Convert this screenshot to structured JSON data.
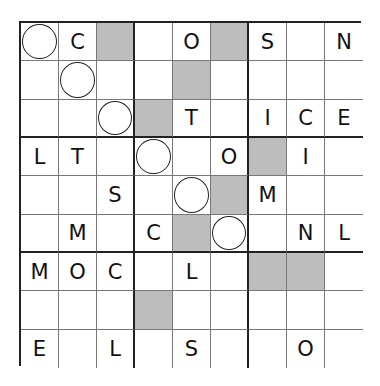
{
  "puzzle": {
    "type": "letter-sudoku",
    "size": 9,
    "legend": {
      "circle": "circle-marker-cell",
      "shaded": "shaded-cell"
    },
    "rows": [
      [
        {
          "v": "",
          "m": "circle"
        },
        {
          "v": "C"
        },
        {
          "v": "",
          "m": "shaded"
        },
        {
          "v": ""
        },
        {
          "v": "O"
        },
        {
          "v": "",
          "m": "shaded"
        },
        {
          "v": "S"
        },
        {
          "v": ""
        },
        {
          "v": "N"
        }
      ],
      [
        {
          "v": ""
        },
        {
          "v": "",
          "m": "circle"
        },
        {
          "v": ""
        },
        {
          "v": ""
        },
        {
          "v": "",
          "m": "shaded"
        },
        {
          "v": ""
        },
        {
          "v": ""
        },
        {
          "v": ""
        },
        {
          "v": ""
        }
      ],
      [
        {
          "v": ""
        },
        {
          "v": ""
        },
        {
          "v": "",
          "m": "circle"
        },
        {
          "v": "",
          "m": "shaded"
        },
        {
          "v": "T"
        },
        {
          "v": ""
        },
        {
          "v": "I"
        },
        {
          "v": "C"
        },
        {
          "v": "E"
        }
      ],
      [
        {
          "v": "L"
        },
        {
          "v": "T"
        },
        {
          "v": ""
        },
        {
          "v": "",
          "m": "circle"
        },
        {
          "v": ""
        },
        {
          "v": "O"
        },
        {
          "v": "",
          "m": "shaded"
        },
        {
          "v": "I"
        },
        {
          "v": ""
        }
      ],
      [
        {
          "v": ""
        },
        {
          "v": ""
        },
        {
          "v": "S"
        },
        {
          "v": ""
        },
        {
          "v": "",
          "m": "circle"
        },
        {
          "v": "",
          "m": "shaded"
        },
        {
          "v": "M"
        },
        {
          "v": ""
        },
        {
          "v": ""
        }
      ],
      [
        {
          "v": ""
        },
        {
          "v": "M"
        },
        {
          "v": ""
        },
        {
          "v": "C"
        },
        {
          "v": "",
          "m": "shaded"
        },
        {
          "v": "",
          "m": "circle"
        },
        {
          "v": ""
        },
        {
          "v": "N"
        },
        {
          "v": "L"
        }
      ],
      [
        {
          "v": "M"
        },
        {
          "v": "O"
        },
        {
          "v": "C"
        },
        {
          "v": ""
        },
        {
          "v": "L"
        },
        {
          "v": ""
        },
        {
          "v": "",
          "m": "shaded"
        },
        {
          "v": "",
          "m": "shaded"
        },
        {
          "v": ""
        }
      ],
      [
        {
          "v": ""
        },
        {
          "v": ""
        },
        {
          "v": ""
        },
        {
          "v": "",
          "m": "shaded"
        },
        {
          "v": ""
        },
        {
          "v": ""
        },
        {
          "v": ""
        },
        {
          "v": ""
        },
        {
          "v": ""
        }
      ],
      [
        {
          "v": "E"
        },
        {
          "v": ""
        },
        {
          "v": "L"
        },
        {
          "v": ""
        },
        {
          "v": "S"
        },
        {
          "v": ""
        },
        {
          "v": ""
        },
        {
          "v": "O"
        },
        {
          "v": ""
        }
      ]
    ]
  }
}
